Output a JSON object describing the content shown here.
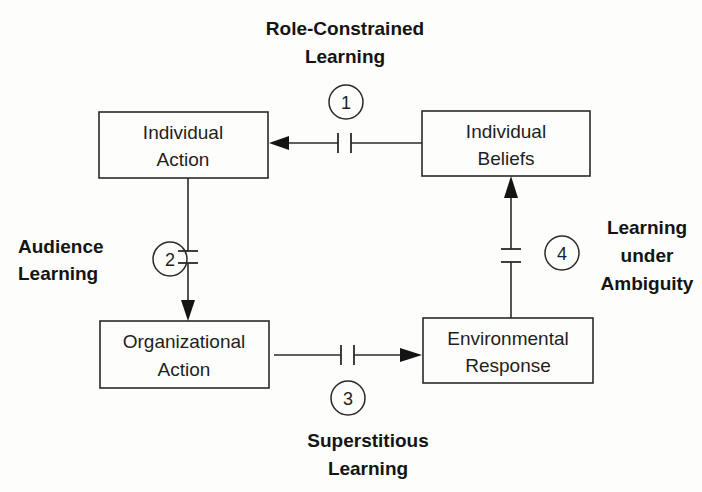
{
  "diagram": {
    "title": "",
    "nodes": [
      {
        "id": "individual_action",
        "lines": [
          "Individual",
          "Action"
        ]
      },
      {
        "id": "individual_beliefs",
        "lines": [
          "Individual",
          "Beliefs"
        ]
      },
      {
        "id": "organizational_action",
        "lines": [
          "Organizational",
          "Action"
        ]
      },
      {
        "id": "environmental_response",
        "lines": [
          "Environmental",
          "Response"
        ]
      }
    ],
    "edges": [
      {
        "number": "1",
        "from": "individual_beliefs",
        "to": "individual_action",
        "label_lines": [
          "Role-Constrained",
          "Learning"
        ],
        "broken": true
      },
      {
        "number": "2",
        "from": "individual_action",
        "to": "organizational_action",
        "label_lines": [
          "Audience",
          "Learning"
        ],
        "broken": true
      },
      {
        "number": "3",
        "from": "organizational_action",
        "to": "environmental_response",
        "label_lines": [
          "Superstitious",
          "Learning"
        ],
        "broken": true
      },
      {
        "number": "4",
        "from": "environmental_response",
        "to": "individual_beliefs",
        "label_lines": [
          "Learning",
          "under",
          "Ambiguity"
        ],
        "broken": true
      }
    ],
    "colors": {
      "stroke": "#2a2a2a",
      "text": "#1a1a1a",
      "background": "#fdfdfb"
    }
  }
}
